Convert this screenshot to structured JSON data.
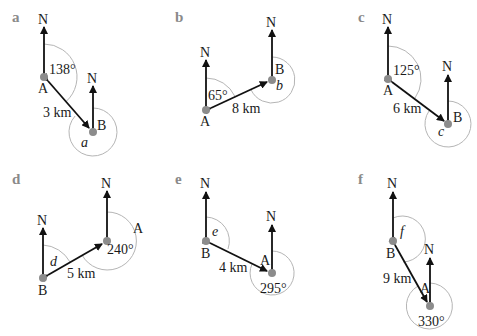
{
  "colors": {
    "line": "#111111",
    "point": "#8c8c8c",
    "arc": "#b5b5b5",
    "panel_label": "#8a8a8a"
  },
  "north_label": "N",
  "panels": [
    {
      "id": "a",
      "label": "a",
      "from": "A",
      "to": "B",
      "known_bearing": "138°",
      "unknown": "a",
      "distance": "3 km",
      "bearing_deg": 138,
      "angle_at": "A",
      "unknown_at": "B"
    },
    {
      "id": "b",
      "label": "b",
      "from": "A",
      "to": "B",
      "known_bearing": "65°",
      "unknown": "b",
      "distance": "8 km",
      "bearing_deg": 65,
      "angle_at": "A",
      "unknown_at": "B"
    },
    {
      "id": "c",
      "label": "c",
      "from": "A",
      "to": "B",
      "known_bearing": "125°",
      "unknown": "c",
      "distance": "6 km",
      "bearing_deg": 125,
      "angle_at": "A",
      "unknown_at": "B"
    },
    {
      "id": "d",
      "label": "d",
      "from": "A",
      "to": "B",
      "known_bearing": "240°",
      "unknown": "d",
      "distance": "5 km",
      "bearing_deg": 240,
      "angle_at": "A",
      "unknown_at": "B"
    },
    {
      "id": "e",
      "label": "e",
      "from": "A",
      "to": "B",
      "known_bearing": "295°",
      "unknown": "e",
      "distance": "4 km",
      "bearing_deg": 295,
      "angle_at": "A",
      "unknown_at": "B"
    },
    {
      "id": "f",
      "label": "f",
      "from": "A",
      "to": "B",
      "known_bearing": "330°",
      "unknown": "f",
      "distance": "9 km",
      "bearing_deg": 330,
      "angle_at": "A",
      "unknown_at": "B"
    }
  ]
}
